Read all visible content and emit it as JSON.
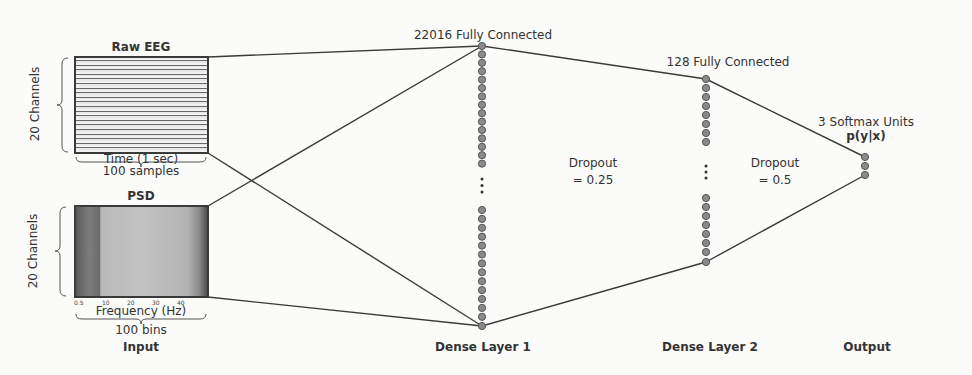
{
  "input": {
    "raw_eeg": {
      "title": "Raw EEG",
      "y_label": "20 Channels",
      "x_label": "Time (1 sec)",
      "x_size": "100 samples"
    },
    "psd": {
      "title": "PSD",
      "y_label": "20 Channels",
      "x_label": "Frequency (Hz)",
      "x_ticks": [
        "0.5",
        "10",
        "20",
        "30",
        "40"
      ],
      "x_size": "100 bins"
    },
    "section_label": "Input"
  },
  "dense_layer_1": {
    "title": "22016 Fully Connected",
    "section_label": "Dense Layer 1",
    "ellipsis": "⋮"
  },
  "dropout_1": {
    "line1": "Dropout",
    "line2": "= 0.25"
  },
  "dense_layer_2": {
    "title": "128 Fully Connected",
    "section_label": "Dense Layer 2",
    "ellipsis": "⋮"
  },
  "dropout_2": {
    "line1": "Dropout",
    "line2": "= 0.5"
  },
  "output": {
    "title": "3 Softmax Units",
    "formula": "p(y|x)",
    "section_label": "Output"
  },
  "colors": {
    "line": "#3a3a3a",
    "node_fill": "#8a8a8a",
    "node_stroke": "#555555"
  }
}
